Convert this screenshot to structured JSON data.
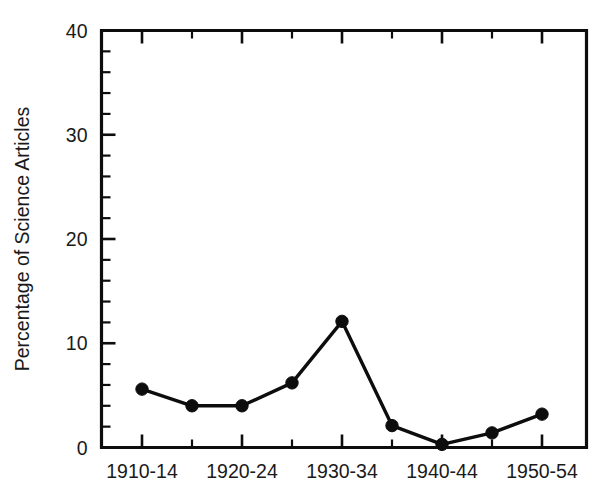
{
  "chart_data": {
    "type": "line",
    "title": "",
    "xlabel": "",
    "ylabel": "Percentage of Science Articles",
    "categories": [
      "1910-14",
      "1915-19",
      "1920-24",
      "1925-29",
      "1930-34",
      "1935-39",
      "1940-44",
      "1945-49",
      "1950-54"
    ],
    "values": [
      5.6,
      4.0,
      4.0,
      6.2,
      12.1,
      2.1,
      0.3,
      1.4,
      3.2
    ],
    "xtick_labels_shown": [
      "1910-14",
      "1920-24",
      "1930-34",
      "1940-44",
      "1950-54"
    ],
    "xtick_labels_hidden": [
      "1915-19",
      "1925-29",
      "1935-39",
      "1945-49"
    ],
    "ylim": [
      0,
      40
    ],
    "ytick_labels": [
      "0",
      "10",
      "20",
      "30",
      "40"
    ],
    "ytick_values": [
      0,
      10,
      20,
      30,
      40
    ],
    "yminor_interval": 2,
    "grid": false,
    "legend": false,
    "marker": "filled-circle",
    "line_color": "#0d0d0d",
    "background": "#ffffff"
  },
  "axes": {
    "y_title": "Percentage of Science Articles"
  }
}
